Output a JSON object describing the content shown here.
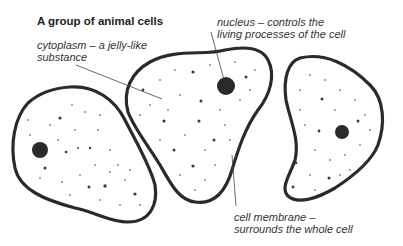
{
  "title": "A group of animal cells",
  "labels": {
    "cytoplasm": {
      "line1": "cytoplasm – a jelly-like",
      "line2": "substance"
    },
    "nucleus": {
      "line1": "nucleus – controls the",
      "line2": "living processes of the cell"
    },
    "membrane": {
      "line1": "cell membrane –",
      "line2": "surrounds the whole cell"
    }
  },
  "cells": [
    {
      "name": "left-cell",
      "nucleus": [
        40,
        150
      ]
    },
    {
      "name": "middle-cell",
      "nucleus": [
        226,
        86
      ]
    },
    {
      "name": "right-cell",
      "nucleus": [
        342,
        132
      ]
    }
  ],
  "colors": {
    "outline": "#2a2a2a",
    "text": "#333333",
    "dots": "#3a3a3a"
  }
}
